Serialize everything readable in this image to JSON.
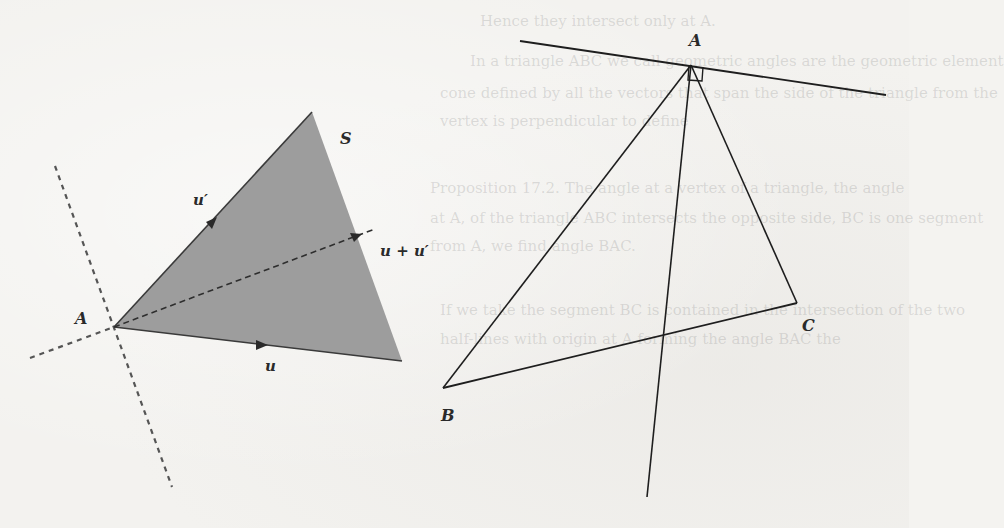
{
  "background_bleed_text": [
    "Hence they intersect only at A.",
    "In a triangle ABC we call geometric angles are the geometric element",
    "cone defined by all the vectors that span the side of the triangle from the",
    "vertex is perpendicular to define",
    "Proposition 17.2. The angle at a vertex of a triangle, the angle",
    "at A, of the triangle ABC intersects the opposite side, BC is one segment",
    "from A, we find angle BAC.",
    "If we take the segment BC is contained in the intersection of the two",
    "half-lines with origin at A forming the angle BAC the"
  ],
  "left_figure": {
    "region_label": "S",
    "vertex_label": "A",
    "vector_u_label": "u",
    "vector_u_prime_label": "u′",
    "vector_sum_label": "u + u′",
    "fill_color": "#9b9b9b",
    "stroke_color": "#3a3a3a"
  },
  "right_figure": {
    "vertex_a_label": "A",
    "vertex_b_label": "B",
    "vertex_c_label": "C",
    "stroke_color": "#1e1e1e",
    "right_angle_marker": true
  }
}
